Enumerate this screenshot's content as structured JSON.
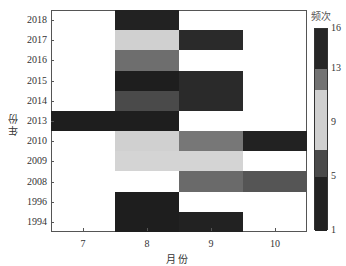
{
  "chart_data": {
    "type": "heatmap",
    "title": "",
    "xlabel": "月份",
    "ylabel": "年份",
    "x_categories": [
      "7",
      "8",
      "9",
      "10"
    ],
    "y_categories": [
      "2018",
      "2017",
      "2016",
      "2015",
      "2014",
      "2013",
      "2010",
      "2009",
      "2008",
      "1996",
      "1994"
    ],
    "colorbar": {
      "label": "频次",
      "ticks": [
        "16",
        "13",
        "9",
        "5",
        "1"
      ],
      "range": [
        1,
        16
      ],
      "bands": [
        {
          "from": 1,
          "to": 5,
          "color": "#222222"
        },
        {
          "from": 5,
          "to": 7,
          "color": "#4a4a4a"
        },
        {
          "from": 7,
          "to": 11.5,
          "color": "#d0d0d0"
        },
        {
          "from": 11.5,
          "to": 13,
          "color": "#737373"
        },
        {
          "from": 13,
          "to": 16,
          "color": "#262626"
        }
      ]
    },
    "cells": [
      {
        "year": "2018",
        "month": "8",
        "value": 2,
        "color": "#222222"
      },
      {
        "year": "2017",
        "month": "8",
        "value": 10,
        "color": "#d0d0d0"
      },
      {
        "year": "2017",
        "month": "9",
        "value": 2,
        "color": "#2a2a2a"
      },
      {
        "year": "2016",
        "month": "8",
        "value": 12,
        "color": "#6e6e6e"
      },
      {
        "year": "2015",
        "month": "8",
        "value": 15,
        "color": "#1e1e1e"
      },
      {
        "year": "2015",
        "month": "9",
        "value": 2,
        "color": "#2a2a2a"
      },
      {
        "year": "2014",
        "month": "8",
        "value": 6,
        "color": "#4a4a4a"
      },
      {
        "year": "2014",
        "month": "9",
        "value": 2,
        "color": "#2a2a2a"
      },
      {
        "year": "2013",
        "month": "7",
        "value": 1,
        "color": "#1e1e1e"
      },
      {
        "year": "2013",
        "month": "8",
        "value": 3,
        "color": "#1e1e1e"
      },
      {
        "year": "2010",
        "month": "8",
        "value": 10,
        "color": "#d0d0d0"
      },
      {
        "year": "2010",
        "month": "9",
        "value": 12,
        "color": "#777777"
      },
      {
        "year": "2010",
        "month": "10",
        "value": 2,
        "color": "#222222"
      },
      {
        "year": "2009",
        "month": "8",
        "value": 10,
        "color": "#d4d4d4"
      },
      {
        "year": "2009",
        "month": "9",
        "value": 10,
        "color": "#d4d4d4"
      },
      {
        "year": "2008",
        "month": "9",
        "value": 12,
        "color": "#6a6a6a"
      },
      {
        "year": "2008",
        "month": "10",
        "value": 6,
        "color": "#555555"
      },
      {
        "year": "1996",
        "month": "8",
        "value": 3,
        "color": "#1e1e1e"
      },
      {
        "year": "1994",
        "month": "8",
        "value": 4,
        "color": "#1e1e1e"
      },
      {
        "year": "1994",
        "month": "9",
        "value": 2,
        "color": "#222222"
      }
    ],
    "grid": false,
    "legend_position": "right (colorbar)"
  }
}
